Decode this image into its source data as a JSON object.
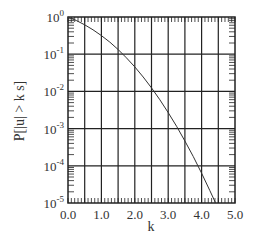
{
  "chart_data": {
    "type": "line",
    "title": "",
    "xlabel": "k",
    "ylabel": "P[|u| > k s]",
    "xlim": [
      0.0,
      5.0
    ],
    "ylim": [
      1e-05,
      1
    ],
    "yscale": "log",
    "grid": true,
    "legend": null,
    "x_ticks": [
      "0.0",
      "1.0",
      "2.0",
      "3.0",
      "4.0",
      "5.0"
    ],
    "y_ticks": [
      {
        "base": "10",
        "exp": "0"
      },
      {
        "base": "10",
        "exp": "-1"
      },
      {
        "base": "10",
        "exp": "-2"
      },
      {
        "base": "10",
        "exp": "-3"
      },
      {
        "base": "10",
        "exp": "-4"
      },
      {
        "base": "10",
        "exp": "-5"
      }
    ],
    "series": [
      {
        "name": "P[|u| > k s]",
        "x": [
          0.0,
          0.25,
          0.5,
          0.75,
          1.0,
          1.25,
          1.5,
          1.75,
          2.0,
          2.25,
          2.5,
          2.75,
          3.0,
          3.25,
          3.5,
          3.75,
          4.0,
          4.25,
          4.42
        ],
        "y": [
          1.0,
          0.803,
          0.617,
          0.453,
          0.317,
          0.211,
          0.134,
          0.0801,
          0.0455,
          0.0244,
          0.0124,
          0.00596,
          0.0027,
          0.00115,
          0.000465,
          0.000177,
          6.33e-05,
          2.14e-05,
          1e-05
        ]
      }
    ]
  },
  "colors": {
    "line": "#333333",
    "grid": "#222222",
    "background": "#ffffff"
  }
}
